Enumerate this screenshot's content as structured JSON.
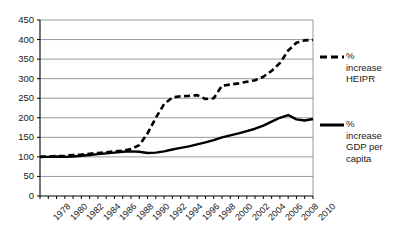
{
  "chart_data": {
    "type": "line",
    "title": "",
    "xlabel": "",
    "ylabel": "",
    "xlim": [
      1978,
      2011
    ],
    "ylim": [
      0,
      450
    ],
    "ytick_step": 50,
    "yticks": [
      0,
      50,
      100,
      150,
      200,
      250,
      300,
      350,
      400,
      450
    ],
    "xticks": [
      1978,
      1980,
      1982,
      1984,
      1986,
      1988,
      1990,
      1992,
      1994,
      1996,
      1998,
      2000,
      2002,
      2004,
      2006,
      2008,
      2010
    ],
    "x": [
      1978,
      1979,
      1980,
      1981,
      1982,
      1983,
      1984,
      1985,
      1986,
      1987,
      1988,
      1989,
      1990,
      1991,
      1992,
      1993,
      1994,
      1995,
      1996,
      1997,
      1998,
      1999,
      2000,
      2001,
      2002,
      2003,
      2004,
      2005,
      2006,
      2007,
      2008,
      2009,
      2010,
      2011
    ],
    "grid": true,
    "grid_axis": "y",
    "legend_position": "right",
    "series": [
      {
        "name": "% increase HEIPR",
        "style": "dashed",
        "color": "#000000",
        "values": [
          100,
          101,
          102,
          103,
          105,
          106,
          108,
          110,
          112,
          114,
          116,
          120,
          130,
          160,
          200,
          235,
          252,
          255,
          256,
          258,
          248,
          250,
          282,
          285,
          288,
          292,
          296,
          305,
          320,
          340,
          372,
          392,
          398,
          399
        ]
      },
      {
        "name": "% increase GDP per capita",
        "style": "solid",
        "color": "#000000",
        "values": [
          100,
          100,
          101,
          100,
          101,
          103,
          105,
          107,
          109,
          111,
          113,
          114,
          113,
          110,
          111,
          114,
          119,
          123,
          127,
          132,
          137,
          143,
          150,
          155,
          160,
          166,
          172,
          180,
          190,
          200,
          207,
          196,
          193,
          197
        ]
      }
    ]
  },
  "legend": {
    "entries": [
      {
        "label_line1": "%",
        "label_line2": "increase",
        "label_line3": "HEIPR",
        "style": "dashed"
      },
      {
        "label_line1": "%",
        "label_line2": "increase",
        "label_line3": "GDP per",
        "label_line4": "capita",
        "style": "solid"
      }
    ]
  },
  "axis_labels": {
    "y": [
      "450",
      "400",
      "350",
      "300",
      "250",
      "200",
      "150",
      "100",
      "50",
      "0"
    ],
    "x": [
      "1978",
      "1980",
      "1982",
      "1984",
      "1986",
      "1988",
      "1990",
      "1992",
      "1994",
      "1996",
      "1998",
      "2000",
      "2002",
      "2004",
      "2006",
      "2008",
      "2010"
    ]
  },
  "colors": {
    "axis": "#000000",
    "grid": "#808080",
    "series": "#000000",
    "background": "#ffffff"
  }
}
